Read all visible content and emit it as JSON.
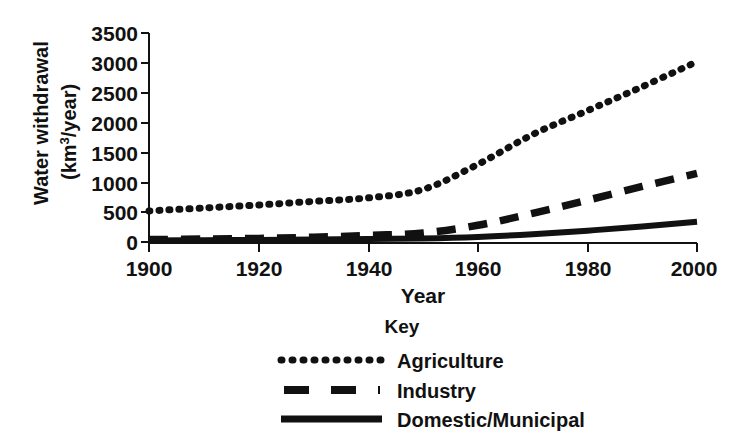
{
  "chart_data": {
    "type": "line",
    "title": "",
    "xlabel": "Year",
    "ylabel": "Water withdrawal (km3/year)",
    "ylabel_line1": "Water withdrawal",
    "ylabel_line2_prefix": "(km",
    "ylabel_line2_sup": "3",
    "ylabel_line2_suffix": "/year)",
    "x": [
      1900,
      1910,
      1920,
      1930,
      1940,
      1950,
      1960,
      1970,
      1980,
      1990,
      2000
    ],
    "xlim": [
      1900,
      2000
    ],
    "ylim": [
      0,
      3500
    ],
    "xticks": [
      1900,
      1920,
      1940,
      1960,
      1980,
      2000
    ],
    "xtick_labels": [
      "1900",
      "1920",
      "1940",
      "1960",
      "1980",
      "2000"
    ],
    "yticks": [
      0,
      500,
      1000,
      1500,
      2000,
      2500,
      3000,
      3500
    ],
    "ytick_labels": [
      "0",
      "500",
      "1000",
      "1500",
      "2000",
      "2500",
      "3000",
      "3500"
    ],
    "grid": false,
    "legend_position": "below",
    "legend_title": "Key",
    "series": [
      {
        "name": "Agriculture",
        "style": "dotted",
        "color": "#111111",
        "values": [
          520,
          570,
          620,
          680,
          740,
          880,
          1300,
          1800,
          2200,
          2600,
          3020
        ]
      },
      {
        "name": "Industry",
        "style": "dashed",
        "color": "#111111",
        "values": [
          40,
          50,
          60,
          80,
          110,
          150,
          280,
          480,
          700,
          930,
          1150
        ]
      },
      {
        "name": "Domestic/Municipal",
        "style": "solid",
        "color": "#111111",
        "values": [
          25,
          30,
          35,
          40,
          50,
          60,
          85,
          130,
          190,
          260,
          340
        ]
      }
    ]
  },
  "legend": {
    "title": "Key",
    "items": [
      {
        "label": "Agriculture",
        "style": "dotted"
      },
      {
        "label": "Industry",
        "style": "dashed"
      },
      {
        "label": "Domestic/Municipal",
        "style": "solid"
      }
    ]
  },
  "axes": {
    "x_title": "Year",
    "y_title_line1": "Water withdrawal",
    "y_title_line2": "(km3/year)"
  }
}
